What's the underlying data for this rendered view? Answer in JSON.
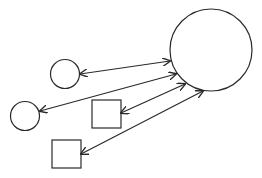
{
  "diagram": {
    "width": 262,
    "height": 178,
    "background": "#ffffff",
    "stroke": "#2a2a2a",
    "stroke_width": 1.2,
    "nodes": [
      {
        "id": "hub",
        "shape": "circle",
        "cx": 211,
        "cy": 50,
        "r": 41
      },
      {
        "id": "circle-a",
        "shape": "circle",
        "cx": 65,
        "cy": 74,
        "r": 14.5
      },
      {
        "id": "circle-b",
        "shape": "circle",
        "cx": 25,
        "cy": 116,
        "r": 14.5
      },
      {
        "id": "square-a",
        "shape": "square",
        "x": 92,
        "y": 100,
        "w": 29,
        "h": 28
      },
      {
        "id": "square-b",
        "shape": "square",
        "x": 52,
        "y": 140,
        "w": 29,
        "h": 28
      }
    ],
    "edges": [
      {
        "id": "hub-circle-a",
        "from": "circle-a",
        "to": "hub",
        "x1": 80,
        "y1": 74,
        "x2": 170,
        "y2": 61,
        "arrow": "both"
      },
      {
        "id": "hub-circle-b",
        "from": "circle-b",
        "to": "hub",
        "x1": 40,
        "y1": 111,
        "x2": 176,
        "y2": 74,
        "arrow": "both"
      },
      {
        "id": "hub-square-a",
        "from": "square-a",
        "to": "hub",
        "x1": 121,
        "y1": 113,
        "x2": 185,
        "y2": 84,
        "arrow": "both"
      },
      {
        "id": "hub-square-b",
        "from": "square-b",
        "to": "hub",
        "x1": 81,
        "y1": 154,
        "x2": 203,
        "y2": 91,
        "arrow": "both"
      }
    ]
  }
}
